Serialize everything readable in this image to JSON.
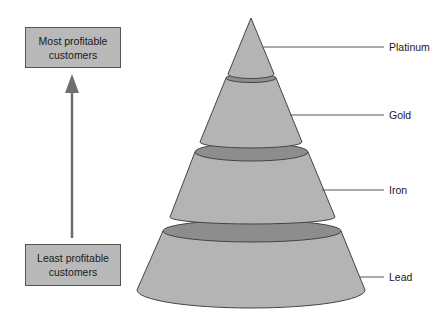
{
  "boxes": {
    "top": {
      "line1": "Most profitable",
      "line2": "customers"
    },
    "bottom": {
      "line1": "Least profitable",
      "line2": "customers"
    }
  },
  "tiers": [
    {
      "label": "Platinum"
    },
    {
      "label": "Gold"
    },
    {
      "label": "Iron"
    },
    {
      "label": "Lead"
    }
  ],
  "colors": {
    "tier_fill": "#b4b4b4",
    "tier_band": "#8d8d8d",
    "box_fill": "#b9b9b9",
    "arrow": "#6e6e6e",
    "outline": "#444444"
  }
}
